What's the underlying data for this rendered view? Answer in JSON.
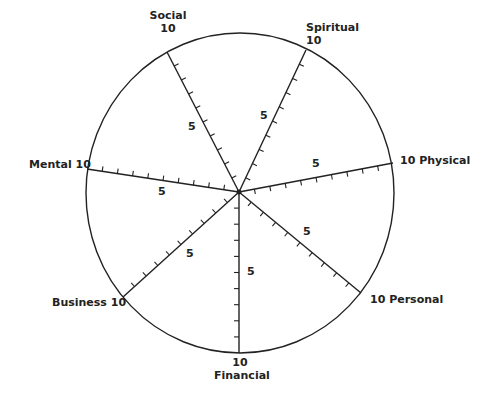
{
  "diagram": {
    "type": "wheel-of-life",
    "scale_max": 10,
    "scale_mid_label": "5",
    "line_color": "#222222",
    "spokes": [
      {
        "name": "Social",
        "label_top": "Social",
        "label_bottom": "10"
      },
      {
        "name": "Spiritual",
        "label_top": "Spiritual",
        "label_bottom": "10"
      },
      {
        "name": "Physical",
        "label": "10 Physical"
      },
      {
        "name": "Personal",
        "label": "10 Personal"
      },
      {
        "name": "Financial",
        "label_top": "10",
        "label_bottom": "Financial"
      },
      {
        "name": "Business",
        "label": "Business 10"
      },
      {
        "name": "Mental",
        "label": "Mental 10"
      }
    ]
  }
}
